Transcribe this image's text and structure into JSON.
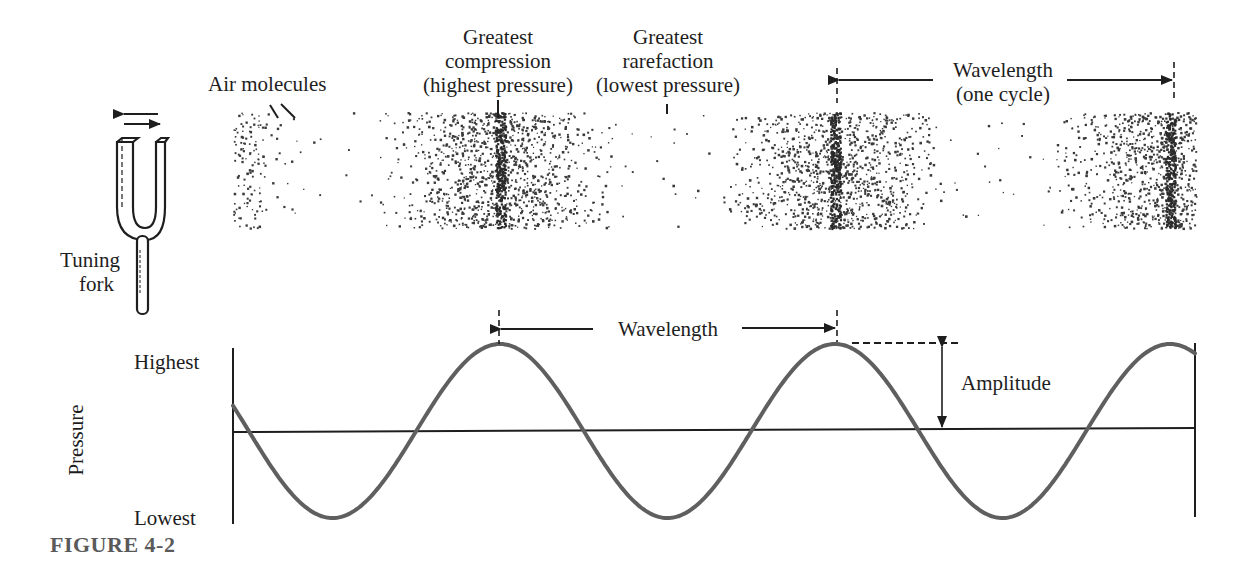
{
  "figure": {
    "caption": "FIGURE 4-2"
  },
  "tuning_fork": {
    "label_line1": "Tuning",
    "label_line2": "fork",
    "icon": "tuning-fork-icon",
    "motion_icon": "double-arrow-left-right-icon"
  },
  "molecule_band": {
    "labels": {
      "air_molecules": "Air molecules",
      "compression": [
        "Greatest",
        "compression",
        "(highest pressure)"
      ],
      "rarefaction": [
        "Greatest",
        "rarefaction",
        "(lowest pressure)"
      ],
      "wavelength": [
        "Wavelength",
        "(one cycle)"
      ]
    },
    "x_range": [
      233,
      1196
    ],
    "y_range": [
      112,
      228
    ],
    "compression_centers_x": [
      500,
      835,
      1170
    ],
    "rarefaction_centers_x": [
      333,
      668,
      1003
    ],
    "dot_color": "#3a3a3a"
  },
  "wave_graph": {
    "ylabel": "Pressure",
    "y_tick_high": "Highest",
    "y_tick_low": "Lowest",
    "wavelength_label": "Wavelength",
    "amplitude_label": "Amplitude",
    "wave_color": "#5f5f5f",
    "axis_color": "#1e1e1e"
  },
  "chart_data": {
    "type": "line",
    "xlabel": "",
    "ylabel": "Pressure",
    "y_ticks": [
      "Lowest",
      "Highest"
    ],
    "series": [
      {
        "name": "Pressure",
        "description": "Sinusoid; starts slightly above baseline, descending; ~2.9 cycles shown",
        "peaks_x_px": [
          500,
          835,
          1180
        ],
        "troughs_x_px": [
          340,
          672,
          1005
        ],
        "baseline_crossings_x_px": [
          240,
          415,
          583,
          750,
          920,
          1090
        ],
        "wavelength_px": 335,
        "amplitude_normalized": 1.0
      }
    ],
    "annotations": [
      "Wavelength (peak to peak)",
      "Amplitude (baseline to peak)"
    ]
  }
}
